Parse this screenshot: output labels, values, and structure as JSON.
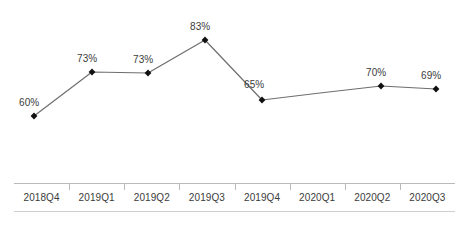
{
  "chart_data": {
    "type": "line",
    "title": "",
    "subtitle": "",
    "xlabel": "",
    "ylabel": "",
    "grid": false,
    "legend": null,
    "y_axis_visible": false,
    "categories": [
      "2018Q4",
      "2019Q1",
      "2019Q2",
      "2019Q3",
      "2019Q4",
      "2020Q1",
      "2020Q2",
      "2020Q3"
    ],
    "values": [
      60,
      73,
      73,
      83,
      65,
      null,
      70,
      69
    ],
    "data_labels": [
      "60%",
      "73%",
      "73%",
      "83%",
      "65%",
      "",
      "70%",
      "69%"
    ],
    "value_suffix": "%",
    "ylim": [
      55,
      88
    ],
    "series": [
      {
        "name": "",
        "marker": "diamond",
        "line_color": "#6e6e6e",
        "marker_color": "#111111",
        "points": [
          {
            "category": "2018Q4",
            "value": 60,
            "label": "60%",
            "x": 34,
            "y": 116,
            "label_x": 19,
            "label_y": 98,
            "has_marker": true
          },
          {
            "category": "2019Q1",
            "value": 73,
            "label": "73%",
            "x": 92,
            "y": 72,
            "label_x": 77,
            "label_y": 54,
            "has_marker": true
          },
          {
            "category": "2019Q2",
            "value": 73,
            "label": "73%",
            "x": 148,
            "y": 73,
            "label_x": 133,
            "label_y": 55,
            "has_marker": true
          },
          {
            "category": "2019Q3",
            "value": 83,
            "label": "83%",
            "x": 205,
            "y": 40,
            "label_x": 190,
            "label_y": 22,
            "has_marker": true
          },
          {
            "category": "2019Q4",
            "value": 65,
            "label": "65%",
            "x": 262,
            "y": 100,
            "label_x": 244,
            "label_y": 80,
            "has_marker": true
          },
          {
            "category": "2020Q1",
            "value": null,
            "label": "",
            "x": 320,
            "y": 93,
            "label_x": 0,
            "label_y": 0,
            "has_marker": false
          },
          {
            "category": "2020Q2",
            "value": 70,
            "label": "70%",
            "x": 381,
            "y": 86,
            "label_x": 366,
            "label_y": 68,
            "has_marker": true
          },
          {
            "category": "2020Q3",
            "value": 69,
            "label": "69%",
            "x": 436,
            "y": 89,
            "label_x": 421,
            "label_y": 71,
            "has_marker": true
          }
        ]
      }
    ]
  },
  "axis": {
    "categories": [
      "2018Q4",
      "2019Q1",
      "2019Q2",
      "2019Q3",
      "2019Q4",
      "2020Q1",
      "2020Q2",
      "2020Q3"
    ]
  },
  "colors": {
    "line": "#6e6e6e",
    "marker": "#111111",
    "text": "#3b3b3b",
    "axis_rule_top": "#b9b9b9",
    "axis_rule_bottom": "#cfcfcf",
    "background": "#ffffff"
  }
}
